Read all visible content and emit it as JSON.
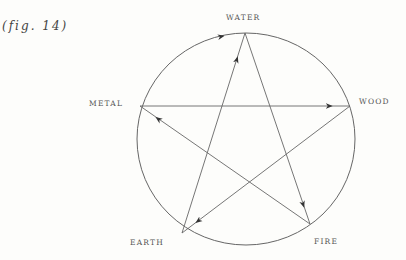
{
  "figure": {
    "caption": "(fig. 14)",
    "type": "five-elements-cycle",
    "stroke_color": "#666666"
  },
  "nodes": [
    {
      "id": "water",
      "label": "WATER"
    },
    {
      "id": "wood",
      "label": "WOOD"
    },
    {
      "id": "fire",
      "label": "FIRE"
    },
    {
      "id": "earth",
      "label": "EARTH"
    },
    {
      "id": "metal",
      "label": "METAL"
    }
  ],
  "edges": [
    {
      "from": "METAL",
      "to": "WATER",
      "kind": "circle-arc"
    },
    {
      "from": "EARTH",
      "to": "WATER",
      "kind": "star-line"
    },
    {
      "from": "WATER",
      "to": "FIRE",
      "kind": "star-line"
    },
    {
      "from": "METAL",
      "to": "WOOD",
      "kind": "star-line"
    },
    {
      "from": "WOOD",
      "to": "EARTH",
      "kind": "star-line"
    },
    {
      "from": "FIRE",
      "to": "METAL",
      "kind": "star-line"
    }
  ]
}
